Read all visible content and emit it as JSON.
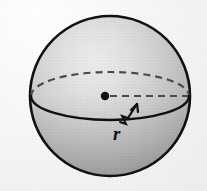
{
  "figure": {
    "kind": "geometry-diagram",
    "background_color": "#f5f5f5",
    "canvas": {
      "width": 207,
      "height": 191
    }
  },
  "sphere": {
    "name": "sphere",
    "center": {
      "x": 110,
      "y": 96
    },
    "radius": 80,
    "outline_color": "#111111",
    "outline_width": 2.6,
    "fill_light": "#e9e9e9",
    "fill_mid": "#bdbdbd",
    "fill_dark": "#8e8e8e",
    "highlight_position": {
      "x": 78,
      "y": 52
    }
  },
  "equator": {
    "name": "equator-ellipse",
    "center": {
      "x": 110,
      "y": 96
    },
    "semi_major_x": 79,
    "semi_minor_y": 24,
    "dashed_color": "#4a4a4a",
    "dash_pattern": "7 5",
    "solid_color": "#111111",
    "solid_width": 2.4,
    "dashed_width": 2.2
  },
  "center_point": {
    "name": "center-dot",
    "x": 105,
    "y": 96,
    "radius": 4.2,
    "color": "#111111"
  },
  "radius_arrow": {
    "name": "radius-arrow",
    "tail": {
      "x": 120,
      "y": 131
    },
    "head": {
      "x": 137,
      "y": 103
    },
    "color": "#111111",
    "width": 2.2,
    "zigzag_break": true
  },
  "labels": {
    "radius": {
      "text": "r",
      "x": 115,
      "y": 140,
      "font_size": 19
    }
  }
}
